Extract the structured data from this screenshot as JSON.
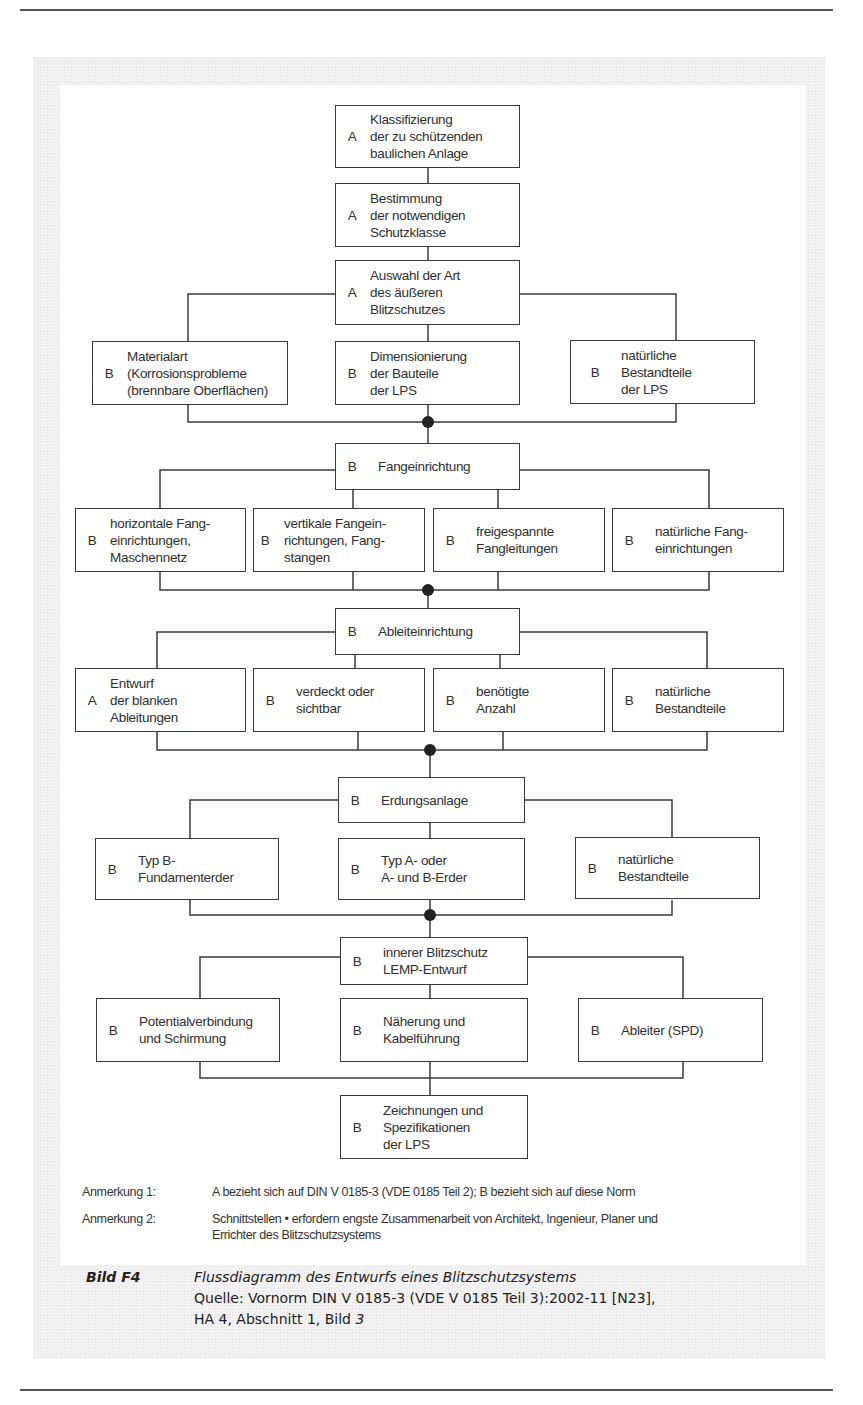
{
  "figure": {
    "id": "Bild F4",
    "title": "Flussdiagramm des Entwurfs eines Blitzschutzsystems",
    "source_line1": "Quelle: Vornorm DIN V 0185-3 (VDE V 0185 Teil 3):2002-11 [N23],",
    "source_line2_prefix": "HA 4, Abschnitt 1, Bild ",
    "source_line2_italic": "3"
  },
  "boxes": {
    "klassifizierung": {
      "code": "A",
      "text": "Klassifizierung\nder zu schützenden\nbaulichen Anlage"
    },
    "bestimmung": {
      "code": "A",
      "text": "Bestimmung\nder notwendigen\nSchutzklasse"
    },
    "auswahl": {
      "code": "A",
      "text": "Auswahl der Art\ndes äußeren\nBlitzschutzes"
    },
    "materialart": {
      "code": "B",
      "text": "Materialart\n(Korrosionsprobleme\n(brennbare Oberflächen)"
    },
    "dimensionierung": {
      "code": "B",
      "text": "Dimensionierung\nder Bauteile\nder LPS"
    },
    "natuerliche_lps": {
      "code": "B",
      "text": "natürliche\nBestandteile\nder LPS"
    },
    "fangeinrichtung": {
      "code": "B",
      "text": "Fangeinrichtung"
    },
    "horizontale": {
      "code": "B",
      "text": "horizontale Fang-\neinrichtungen,\nMaschennetz"
    },
    "vertikale": {
      "code": "B",
      "text": "vertikale Fangein-\nrichtungen, Fang-\nstangen"
    },
    "freigespannte": {
      "code": "B",
      "text": "freigespannte\nFangleitungen"
    },
    "natuerliche_fang": {
      "code": "B",
      "text": "natürliche Fang-\neinrichtungen"
    },
    "ableiteinrichtung": {
      "code": "B",
      "text": "Ableiteinrichtung"
    },
    "entwurf": {
      "code": "A",
      "text": "Entwurf\nder blanken\nAbleitungen"
    },
    "verdeckt": {
      "code": "B",
      "text": "verdeckt oder\nsichtbar"
    },
    "anzahl": {
      "code": "B",
      "text": "benötigte\nAnzahl"
    },
    "natuerliche_abl": {
      "code": "B",
      "text": "natürliche\nBestandteile"
    },
    "erdungsanlage": {
      "code": "B",
      "text": "Erdungsanlage"
    },
    "typ_b": {
      "code": "B",
      "text": "Typ B-\nFundamenterder"
    },
    "typ_a": {
      "code": "B",
      "text": "Typ A- oder\nA- und B-Erder"
    },
    "natuerliche_erd": {
      "code": "B",
      "text": "natürliche\nBestandteile"
    },
    "innerer": {
      "code": "B",
      "text": "innerer Blitzschutz\nLEMP-Entwurf"
    },
    "potential": {
      "code": "B",
      "text": "Potentialverbindung\nund Schirmung"
    },
    "naeherung": {
      "code": "B",
      "text": "Näherung und\nKabelführung"
    },
    "ableiter": {
      "code": "B",
      "text": "Ableiter (SPD)"
    },
    "zeichnungen": {
      "code": "B",
      "text": "Zeichnungen und\nSpezifikationen\nder LPS"
    }
  },
  "notes": [
    {
      "label": "Anmerkung 1:",
      "text": "A bezieht sich auf DIN V 0185-3 (VDE 0185 Teil 2); B bezieht sich auf diese Norm"
    },
    {
      "label": "Anmerkung 2:",
      "text": "Schnittstellen • erfordern engste Zusammenarbeit von Architekt, Ingenieur, Planer und\nErrichter des Blitzschutzsystems"
    }
  ],
  "colors": {
    "line": "#3a3a3a",
    "panel_gray": "#ececec",
    "junction_dot": "#222222"
  }
}
